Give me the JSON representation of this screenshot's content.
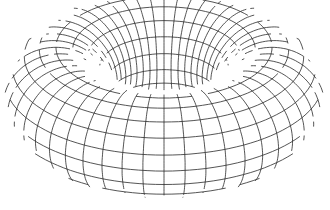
{
  "figure": {
    "caption": "",
    "stroke_color": "#2a2a2a",
    "background": "#ffffff"
  },
  "torus": {
    "center_x": 164,
    "center_y": 95,
    "major_radius": 108,
    "minor_radius": 54,
    "tilt_deg": 62,
    "scale_x": 1.0,
    "scale_y": 1.0,
    "u_segments": 48,
    "v_segments": 20
  }
}
